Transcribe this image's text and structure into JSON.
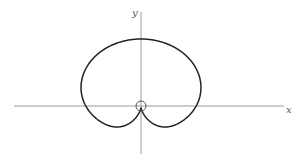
{
  "diagram": {
    "type": "polar-curve",
    "axes": {
      "x_label": "x",
      "y_label": "y"
    },
    "origin_marker": "small-circle",
    "colors": {
      "curve": "#222222",
      "axes": "#9a9a9a",
      "background": "#ffffff"
    }
  }
}
